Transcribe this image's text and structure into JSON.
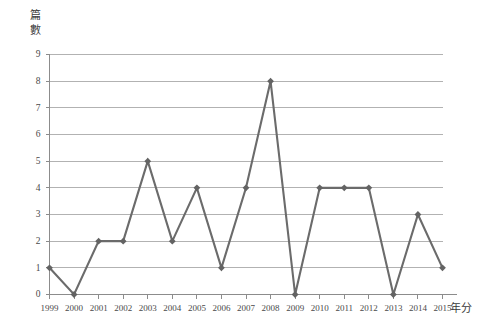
{
  "chart_data": {
    "type": "line",
    "title": "",
    "xlabel": "年分",
    "ylabel": "篇數",
    "categories": [
      "1999",
      "2000",
      "2001",
      "2002",
      "2003",
      "2004",
      "2005",
      "2006",
      "2007",
      "2008",
      "2009",
      "2010",
      "2011",
      "2012",
      "2013",
      "2014",
      "2015"
    ],
    "values": [
      1,
      0,
      2,
      2,
      5,
      2,
      4,
      1,
      4,
      8,
      0,
      4,
      4,
      4,
      0,
      3,
      1
    ],
    "ylim": [
      0,
      9
    ],
    "yticks": [
      "0",
      "1",
      "2",
      "3",
      "4",
      "5",
      "6",
      "7",
      "8",
      "9"
    ],
    "xtick_labels": [
      "1999",
      "2000",
      "2001",
      "2002",
      "2003",
      "2004",
      "2005",
      "2006",
      "2007",
      "2008",
      "2009",
      "2010",
      "2011",
      "2012",
      "2013",
      "2014",
      "2015"
    ],
    "grid": "horizontal",
    "legend": "none",
    "series_color": "#6b6b6b",
    "marker_color": "#636363",
    "gridline_color": "#b2b2b2",
    "axis_color": "#8c8c8c"
  },
  "axes": {
    "y_title_text": "篇\n數",
    "x_title_text": "年分"
  }
}
